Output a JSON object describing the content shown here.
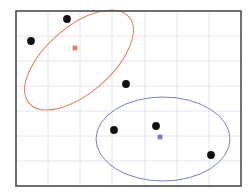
{
  "figure": {
    "background_color": "#ffffff",
    "width": 252,
    "height": 196
  },
  "axes": {
    "frame_color": "#4d4d4d",
    "frame_width": 1.6,
    "left": 16,
    "top": 11,
    "right": 241,
    "bottom": 186,
    "grid_color": "#dde3ef",
    "grid_on": true,
    "x_gridlines": [
      48,
      80,
      112,
      145,
      177,
      209
    ],
    "y_gridlines": [
      36,
      61,
      86,
      111,
      136,
      161
    ],
    "xticklabels": [],
    "yticklabels": []
  },
  "chart_data": {
    "type": "scatter",
    "title": "",
    "xlabel": "",
    "ylabel": "",
    "xlim": [
      16,
      241
    ],
    "ylim": [
      186,
      11
    ],
    "grid": true,
    "legend": "none",
    "point_color": "#111111",
    "point_size": 5.2,
    "series": [
      {
        "name": "cluster-1",
        "color": "#e2805f",
        "points": [
          {
            "x": 67,
            "y": 19
          },
          {
            "x": 31,
            "y": 41
          },
          {
            "x": 126,
            "y": 84
          }
        ],
        "centroid": {
          "x": 75,
          "y": 48
        },
        "centroid_color": "#e2805f",
        "ellipse": {
          "cx": 79,
          "cy": 60,
          "rx": 66,
          "ry": 33,
          "rotation": -41,
          "stroke": "#e2805f",
          "stroke_width": 1.0,
          "fill": "none"
        }
      },
      {
        "name": "cluster-2",
        "color": "#7b7fc4",
        "points": [
          {
            "x": 114,
            "y": 130
          },
          {
            "x": 156,
            "y": 126
          },
          {
            "x": 211,
            "y": 155
          }
        ],
        "centroid": {
          "x": 160,
          "y": 137
        },
        "centroid_color": "#7b7fc4",
        "ellipse": {
          "cx": 163,
          "cy": 139,
          "rx": 67,
          "ry": 42,
          "rotation": 0,
          "stroke": "#7b7fc4",
          "stroke_width": 1.0,
          "fill": "none"
        }
      }
    ]
  }
}
